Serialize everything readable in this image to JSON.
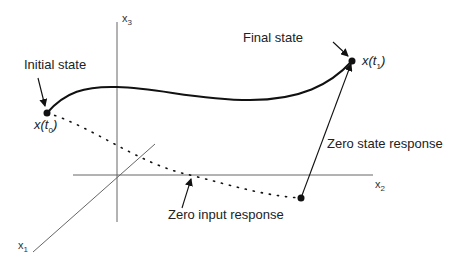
{
  "diagram": {
    "type": "state-space trajectory",
    "axes": {
      "x1": {
        "label": "x",
        "sub": "1"
      },
      "x2": {
        "label": "x",
        "sub": "2"
      },
      "x3": {
        "label": "x",
        "sub": "3"
      }
    },
    "labels": {
      "initial_state": "Initial state",
      "final_state": "Final state",
      "zero_state_response": "Zero state response",
      "zero_input_response": "Zero input response"
    },
    "points": {
      "initial": {
        "label": "x(",
        "var": "t",
        "sub": "0",
        "close": ")"
      },
      "final": {
        "label": "x(",
        "var": "t",
        "sub": "1",
        "close": ")"
      }
    },
    "colors": {
      "ink": "#111111",
      "axis": "#555555",
      "background": "#ffffff"
    }
  }
}
